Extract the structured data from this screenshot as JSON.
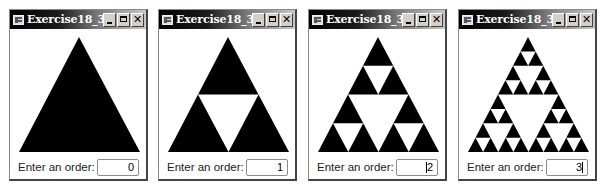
{
  "windows": [
    {
      "title": "Exercise18_36",
      "prompt_label": "Enter an order:",
      "order_value": "0",
      "order": 0,
      "caret": "none"
    },
    {
      "title": "Exercise18_36",
      "prompt_label": "Enter an order:",
      "order_value": "1",
      "order": 1,
      "caret": "none"
    },
    {
      "title": "Exercise18_36",
      "prompt_label": "Enter an order:",
      "order_value": "2",
      "order": 2,
      "caret": "before"
    },
    {
      "title": "Exercise18_36",
      "prompt_label": "Enter an order:",
      "order_value": "3",
      "order": 3,
      "caret": "after"
    }
  ],
  "titlebar_buttons": {
    "minimize": "minimize-icon",
    "maximize": "maximize-icon",
    "close": "✕"
  },
  "colors": {
    "triangle_fill": "#000000",
    "canvas_bg": "#ffffff",
    "titlebar_start": "#000000",
    "titlebar_end": "#c8c8c8"
  }
}
